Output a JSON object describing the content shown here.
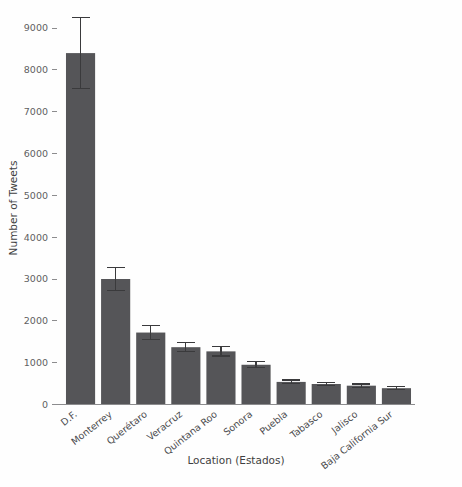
{
  "chart_data": {
    "type": "bar",
    "title": "",
    "xlabel": "Location (Estados)",
    "ylabel": "Number of Tweets",
    "categories": [
      "D.F.",
      "Monterrey",
      "Querétaro",
      "Veracruz",
      "Quintana Roo",
      "Sonora",
      "Puebla",
      "Tabasco",
      "Jalisco",
      "Baja California Sur"
    ],
    "values": [
      8400,
      3000,
      1720,
      1370,
      1270,
      950,
      540,
      490,
      450,
      390
    ],
    "errors": [
      850,
      280,
      160,
      110,
      110,
      70,
      45,
      40,
      40,
      35
    ],
    "ylim": [
      0,
      9000
    ],
    "yticks": [
      0,
      1000,
      2000,
      3000,
      4000,
      5000,
      6000,
      7000,
      8000,
      9000
    ],
    "ytick_labels": [
      "0",
      "1000",
      "2000",
      "3000",
      "4000",
      "5000",
      "6000",
      "7000",
      "8000",
      "9000"
    ],
    "grid": false,
    "legend": "none",
    "bar_color": "#555558",
    "error_color": "#3a3a3c",
    "background_color": "#fefefe"
  }
}
